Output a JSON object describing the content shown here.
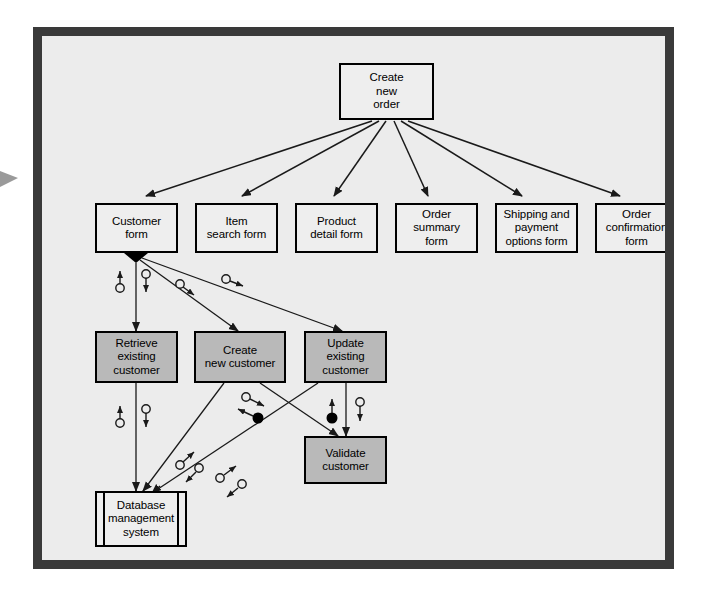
{
  "diagram": {
    "background_color": "#ececec",
    "frame_color": "#3a3a3a",
    "form_node_color": "#eeeeee",
    "process_node_color": "#b9b9b9",
    "line_color": "#1a1a1a"
  },
  "nodes": {
    "root": {
      "label": "Create\nnew\norder",
      "type": "form",
      "x": 297,
      "y": 27,
      "w": 95,
      "h": 57
    },
    "customer_form": {
      "label": "Customer\nform",
      "type": "form",
      "x": 53,
      "y": 167,
      "w": 83,
      "h": 50
    },
    "item_search_form": {
      "label": "Item\nsearch form",
      "type": "form",
      "x": 153,
      "y": 167,
      "w": 83,
      "h": 50
    },
    "product_detail_form": {
      "label": "Product\ndetail form",
      "type": "form",
      "x": 253,
      "y": 167,
      "w": 83,
      "h": 50
    },
    "order_summary_form": {
      "label": "Order\nsummary\nform",
      "type": "form",
      "x": 353,
      "y": 167,
      "w": 83,
      "h": 50
    },
    "shipping_payment_form": {
      "label": "Shipping and\npayment\noptions form",
      "type": "form",
      "x": 453,
      "y": 167,
      "w": 83,
      "h": 50
    },
    "order_confirmation_form": {
      "label": "Order\nconfirmation\nform",
      "type": "form",
      "x": 553,
      "y": 167,
      "w": 83,
      "h": 50
    },
    "retrieve_existing_customer": {
      "label": "Retrieve\nexisting\ncustomer",
      "type": "process",
      "x": 53,
      "y": 295,
      "w": 83,
      "h": 52
    },
    "create_new_customer": {
      "label": "Create\nnew customer",
      "type": "process",
      "x": 152,
      "y": 295,
      "w": 92,
      "h": 52
    },
    "update_existing_customer": {
      "label": "Update\nexisting\ncustomer",
      "type": "process",
      "x": 262,
      "y": 295,
      "w": 83,
      "h": 52
    },
    "validate_customer": {
      "label": "Validate\ncustomer",
      "type": "process",
      "x": 262,
      "y": 400,
      "w": 83,
      "h": 48
    },
    "database_management_system": {
      "label": "Database\nmanagement\nsystem",
      "type": "store",
      "x": 53,
      "y": 455,
      "w": 92,
      "h": 56
    }
  },
  "connections": [
    {
      "name": "root-to-customer-form",
      "from": "root",
      "to": "customer_form",
      "style": "arrow"
    },
    {
      "name": "root-to-item-search-form",
      "from": "root",
      "to": "item_search_form",
      "style": "arrow"
    },
    {
      "name": "root-to-product-detail-form",
      "from": "root",
      "to": "product_detail_form",
      "style": "arrow"
    },
    {
      "name": "root-to-order-summary-form",
      "from": "root",
      "to": "order_summary_form",
      "style": "arrow"
    },
    {
      "name": "root-to-shipping-payment-form",
      "from": "root",
      "to": "shipping_payment_form",
      "style": "arrow"
    },
    {
      "name": "root-to-order-confirmation-form",
      "from": "root",
      "to": "order_confirmation_form",
      "style": "arrow"
    },
    {
      "name": "customer-form-to-retrieve",
      "from": "customer_form",
      "to": "retrieve_existing_customer",
      "style": "link",
      "aggregation": true
    },
    {
      "name": "customer-form-to-create",
      "from": "customer_form",
      "to": "create_new_customer",
      "style": "link",
      "aggregation": true
    },
    {
      "name": "customer-form-to-update",
      "from": "customer_form",
      "to": "update_existing_customer",
      "style": "link",
      "aggregation": true
    },
    {
      "name": "retrieve-to-database",
      "from": "retrieve_existing_customer",
      "to": "database_management_system",
      "style": "link"
    },
    {
      "name": "create-to-database",
      "from": "create_new_customer",
      "to": "database_management_system",
      "style": "link"
    },
    {
      "name": "update-to-database",
      "from": "update_existing_customer",
      "to": "database_management_system",
      "style": "link"
    },
    {
      "name": "create-to-validate",
      "from": "create_new_customer",
      "to": "validate_customer",
      "style": "link"
    },
    {
      "name": "update-to-validate",
      "from": "update_existing_customer",
      "to": "validate_customer",
      "style": "link"
    }
  ],
  "messages": [
    {
      "name": "msg-customer-form-retrieve-up",
      "marker": "hollow",
      "direction": "up"
    },
    {
      "name": "msg-customer-form-retrieve-down",
      "marker": "hollow",
      "direction": "down"
    },
    {
      "name": "msg-customer-form-create",
      "marker": "hollow",
      "direction": "toward-create"
    },
    {
      "name": "msg-customer-form-update",
      "marker": "hollow",
      "direction": "toward-update"
    },
    {
      "name": "msg-retrieve-database-up",
      "marker": "hollow",
      "direction": "up"
    },
    {
      "name": "msg-retrieve-database-down",
      "marker": "hollow",
      "direction": "down"
    },
    {
      "name": "msg-create-database-out",
      "marker": "hollow",
      "direction": "up-right"
    },
    {
      "name": "msg-create-database-in",
      "marker": "hollow",
      "direction": "down-left"
    },
    {
      "name": "msg-update-database-out",
      "marker": "hollow",
      "direction": "up-right"
    },
    {
      "name": "msg-update-database-in",
      "marker": "hollow",
      "direction": "down-left"
    },
    {
      "name": "msg-create-validate-out",
      "marker": "hollow",
      "direction": "right"
    },
    {
      "name": "msg-create-validate-in",
      "marker": "filled",
      "direction": "left"
    },
    {
      "name": "msg-update-validate-up",
      "marker": "filled",
      "direction": "up"
    },
    {
      "name": "msg-update-validate-down",
      "marker": "hollow",
      "direction": "down"
    }
  ],
  "edge_marker": {
    "name": "page-edge-arrow",
    "visible": true
  }
}
